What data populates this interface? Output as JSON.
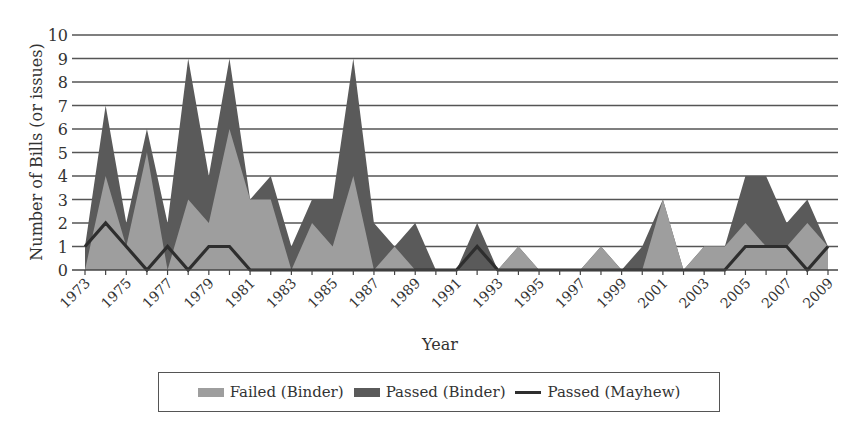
{
  "chart_data": {
    "type": "area",
    "stacked": true,
    "title": "",
    "xlabel": "Year",
    "ylabel": "Number of Bills (or issues)",
    "ylim": [
      0,
      10
    ],
    "yticks": [
      0,
      1,
      2,
      3,
      4,
      5,
      6,
      7,
      8,
      9,
      10
    ],
    "grid": true,
    "legend_position": "bottom",
    "x": [
      1973,
      1974,
      1975,
      1976,
      1977,
      1978,
      1979,
      1980,
      1981,
      1982,
      1983,
      1984,
      1985,
      1986,
      1987,
      1988,
      1989,
      1990,
      1991,
      1992,
      1993,
      1994,
      1995,
      1996,
      1997,
      1998,
      1999,
      2000,
      2001,
      2002,
      2003,
      2004,
      2005,
      2006,
      2007,
      2008,
      2009
    ],
    "xtick_labels": [
      "1973",
      "1975",
      "1977",
      "1979",
      "1981",
      "1983",
      "1985",
      "1987",
      "1989",
      "1991",
      "1993",
      "1995",
      "1997",
      "1999",
      "2001",
      "2003",
      "2005",
      "2007",
      "2009"
    ],
    "series": [
      {
        "name": "Failed (Binder)",
        "kind": "area",
        "color": "#9e9e9e",
        "values": [
          0,
          4,
          1,
          5,
          0,
          3,
          2,
          6,
          3,
          3,
          0,
          2,
          1,
          4,
          0,
          1,
          0,
          0,
          0,
          0,
          0,
          1,
          0,
          0,
          0,
          1,
          0,
          0,
          3,
          0,
          1,
          1,
          2,
          1,
          1,
          2,
          1
        ]
      },
      {
        "name": "Passed (Binder)",
        "kind": "area",
        "color": "#5a5a5a",
        "values": [
          1,
          3,
          1,
          1,
          2,
          6,
          2,
          3,
          0,
          1,
          1,
          1,
          2,
          5,
          2,
          0,
          2,
          0,
          0,
          2,
          0,
          0,
          0,
          0,
          0,
          0,
          0,
          1,
          0,
          0,
          0,
          0,
          2,
          3,
          1,
          1,
          0
        ]
      },
      {
        "name": "Passed (Mayhew)",
        "kind": "line",
        "color": "#2e2e2e",
        "values": [
          1,
          2,
          1,
          0,
          1,
          0,
          1,
          1,
          0,
          0,
          0,
          0,
          0,
          0,
          0,
          0,
          0,
          0,
          0,
          1,
          0,
          0,
          0,
          0,
          0,
          0,
          0,
          0,
          0,
          0,
          0,
          0,
          1,
          1,
          1,
          0,
          1
        ]
      }
    ]
  },
  "legend": {
    "items": [
      "Failed (Binder)",
      "Passed (Binder)",
      "Passed (Mayhew)"
    ]
  }
}
